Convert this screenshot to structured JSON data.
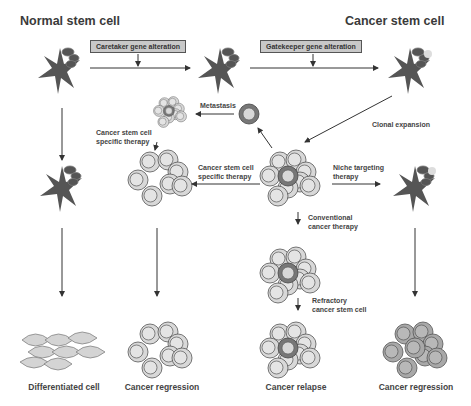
{
  "titles": {
    "normal": "Normal stem cell",
    "cancer": "Cancer stem cell"
  },
  "boxes": {
    "caretaker": "Caretaker gene alteration",
    "gatekeeper": "Gatekeeper gene alteration"
  },
  "labels": {
    "metastasis": "Metastasis",
    "csc_therapy_top_line1": "Cancer stem cell",
    "csc_therapy_top_line2": "specific therapy",
    "csc_therapy_mid_line1": "Cancer stem cell",
    "csc_therapy_mid_line2": "specific therapy",
    "clonal_expansion": "Clonal expansion",
    "niche_line1": "Niche targeting",
    "niche_line2": "therapy",
    "conventional_line1": "Conventional",
    "conventional_line2": "cancer therapy",
    "refractory_line1": "Refractory",
    "refractory_line2": "cancer stem cell"
  },
  "captions": {
    "differentiated": "Differentiated cell",
    "regression_left": "Cancer regression",
    "relapse": "Cancer relapse",
    "regression_right": "Cancer regression"
  },
  "colors": {
    "star_cell": "#5a5a5a",
    "cell_fill": "#d6d6d6",
    "cell_stroke": "#555555",
    "csc_ring": "#7a7a7a",
    "box_fill": "#c8c8c8"
  }
}
